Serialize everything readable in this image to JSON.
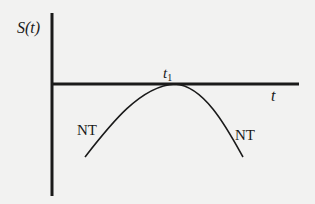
{
  "diagram": {
    "y_axis_label": "S(t)",
    "x_axis_label": "t",
    "peak_label_base": "t",
    "peak_label_sub": "1",
    "curve_left_label": "NT",
    "curve_right_label": "NT",
    "colors": {
      "background": "#f2f2f1",
      "ink": "#1a1a1a"
    },
    "curve": {
      "description": "inverted-U curve touching the t-axis at t1",
      "left_end": [
        85,
        157
      ],
      "peak": [
        175,
        84
      ],
      "right_end": [
        243,
        157
      ]
    }
  }
}
